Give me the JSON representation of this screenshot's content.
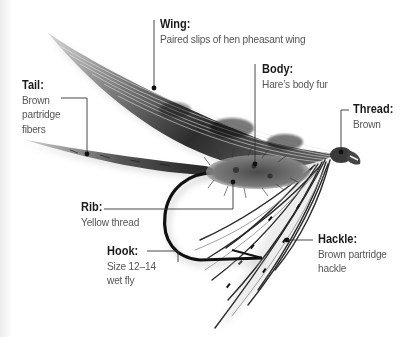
{
  "diagram": {
    "colors": {
      "text_title": "#1a1a1a",
      "text_desc": "#555555",
      "leader_line": "#333333",
      "background": "#ffffff"
    },
    "labels": {
      "wing": {
        "title": "Wing:",
        "lines": [
          "Paired slips of hen pheasant wing"
        ]
      },
      "tail": {
        "title": "Tail:",
        "lines": [
          "Brown",
          "partridge",
          "fibers"
        ]
      },
      "body": {
        "title": "Body:",
        "lines": [
          "Hare’s body fur"
        ]
      },
      "thread": {
        "title": "Thread:",
        "lines": [
          "Brown"
        ]
      },
      "rib": {
        "title": "Rib:",
        "lines": [
          "Yellow thread"
        ]
      },
      "hackle": {
        "title": "Hackle:",
        "lines": [
          "Brown partridge",
          "hackle"
        ]
      },
      "hook": {
        "title": "Hook:",
        "lines": [
          "Size 12–14",
          "wet fly"
        ]
      }
    }
  }
}
